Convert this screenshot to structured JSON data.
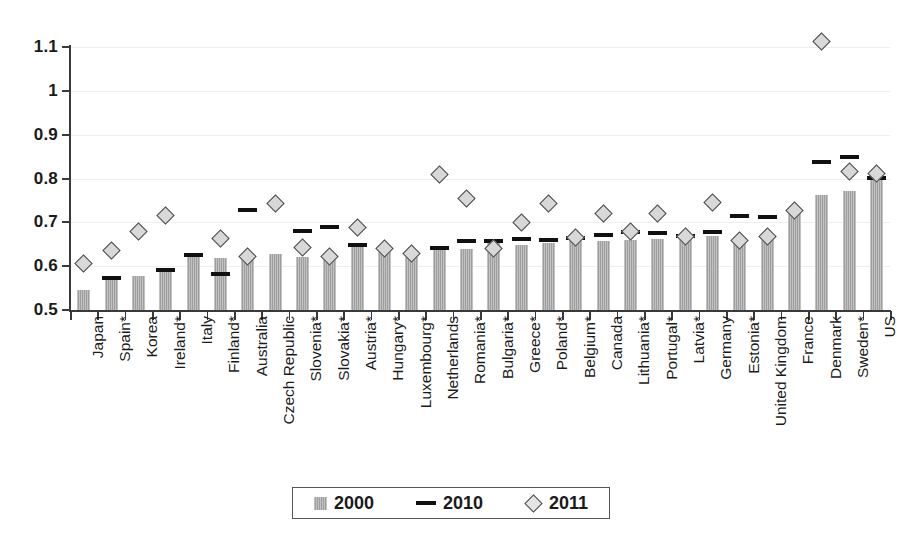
{
  "chart_data": {
    "type": "bar",
    "title": "",
    "xlabel": "",
    "ylabel": "",
    "ylim": [
      0.5,
      1.1
    ],
    "ytick_labels": [
      "1.1",
      "1",
      "0.9",
      "0.8",
      "0.7",
      "0.6",
      "0.5"
    ],
    "ytick_values": [
      1.1,
      1.0,
      0.9,
      0.8,
      0.7,
      0.6,
      0.5
    ],
    "grid": true,
    "legend_position": "bottom-center",
    "legend": [
      "2000",
      "2010",
      "2011"
    ],
    "categories": [
      "Japan",
      "Spain*",
      "Korea",
      "Ireland*",
      "Italy",
      "Finland*",
      "Australia",
      "Czech Republic",
      "Slovenia*",
      "Slovakia*",
      "Austria*",
      "Hungary*",
      "Luxembourg*",
      "Netherlands",
      "Romania*",
      "Bulgaria*",
      "Greece*",
      "Poland*",
      "Belgium*",
      "Canada",
      "Lithuania*",
      "Portugal*",
      "Latvia*",
      "Germany",
      "Estonia*",
      "United Kingdom",
      "France",
      "Denmark",
      "Sweden*",
      "US"
    ],
    "series": [
      {
        "name": "2000",
        "marker": "bar",
        "values": [
          0.545,
          0.568,
          0.578,
          0.588,
          0.622,
          0.618,
          0.627,
          0.627,
          0.622,
          0.62,
          0.645,
          0.637,
          0.63,
          0.642,
          0.64,
          0.652,
          0.648,
          0.652,
          0.662,
          0.657,
          0.66,
          0.662,
          0.662,
          0.668,
          0.66,
          0.665,
          0.722,
          0.762,
          0.772,
          0.8
        ]
      },
      {
        "name": "2010",
        "marker": "dash",
        "values": [
          null,
          0.572,
          null,
          0.592,
          0.625,
          0.582,
          0.728,
          null,
          0.68,
          0.69,
          0.648,
          null,
          null,
          0.642,
          0.657,
          0.658,
          0.662,
          0.66,
          0.665,
          0.672,
          0.678,
          0.675,
          0.668,
          0.678,
          0.715,
          0.712,
          null,
          0.838,
          0.848,
          0.802
        ]
      },
      {
        "name": "2011",
        "marker": "diamond",
        "values": [
          0.605,
          0.635,
          0.678,
          0.715,
          null,
          0.662,
          0.622,
          0.742,
          0.642,
          0.622,
          0.688,
          0.64,
          0.63,
          0.81,
          0.755,
          0.64,
          0.7,
          0.742,
          0.665,
          0.72,
          0.68,
          0.72,
          0.668,
          0.745,
          0.658,
          0.668,
          0.728,
          1.112,
          0.815,
          0.812
        ]
      }
    ]
  },
  "colors": {
    "bar_2000": "#a8a8a8",
    "dash_2010": "#111111",
    "diamond_2011_fill": "#d8d8d8",
    "diamond_2011_stroke": "#4a4a4a",
    "axis": "#3a3a3a",
    "grid": "#eeeeee",
    "background": "#ffffff"
  }
}
